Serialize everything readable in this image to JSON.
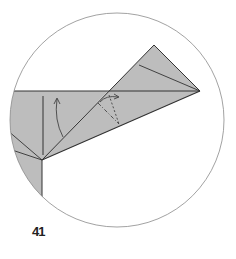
{
  "diagram": {
    "type": "origami-fold-step",
    "step_number": "41",
    "colors": {
      "paper": "#bdbdbd",
      "line": "#333333",
      "circle": "#8a8a8a",
      "background": "#ffffff"
    },
    "elements": [
      "circular-detail-frame",
      "folded-paper-shape",
      "valley-fold-arrow",
      "mountain-fold-dash-dot-line",
      "swivel-fold-arrow"
    ]
  }
}
